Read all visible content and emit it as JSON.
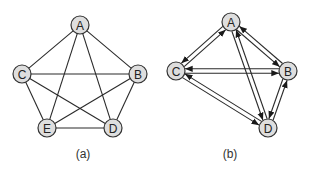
{
  "figure": {
    "node_radius": 9,
    "colors": {
      "node_fill": "#dedede",
      "node_stroke": "#333333",
      "edge": "#2a2a2a",
      "background": "#ffffff"
    },
    "panels": [
      {
        "id": "a",
        "caption": "(a)",
        "caption_pos": [
          83,
          158
        ],
        "directed": false,
        "nodes": [
          {
            "id": "A",
            "label": "A",
            "x": 80,
            "y": 25
          },
          {
            "id": "B",
            "label": "B",
            "x": 138,
            "y": 74
          },
          {
            "id": "C",
            "label": "C",
            "x": 22,
            "y": 74
          },
          {
            "id": "D",
            "label": "D",
            "x": 113,
            "y": 128
          },
          {
            "id": "E",
            "label": "E",
            "x": 47,
            "y": 128
          }
        ],
        "edges": [
          [
            "A",
            "B"
          ],
          [
            "A",
            "C"
          ],
          [
            "A",
            "D"
          ],
          [
            "A",
            "E"
          ],
          [
            "B",
            "C"
          ],
          [
            "B",
            "D"
          ],
          [
            "B",
            "E"
          ],
          [
            "C",
            "D"
          ],
          [
            "C",
            "E"
          ],
          [
            "D",
            "E"
          ]
        ]
      },
      {
        "id": "b",
        "caption": "(b)",
        "caption_pos": [
          230,
          158
        ],
        "directed": true,
        "nodes": [
          {
            "id": "A",
            "label": "A",
            "x": 231,
            "y": 22
          },
          {
            "id": "B",
            "label": "B",
            "x": 288,
            "y": 71
          },
          {
            "id": "C",
            "label": "C",
            "x": 176,
            "y": 71
          },
          {
            "id": "D",
            "label": "D",
            "x": 268,
            "y": 128
          }
        ],
        "edges": [
          [
            "A",
            "C"
          ],
          [
            "C",
            "A"
          ],
          [
            "A",
            "B"
          ],
          [
            "B",
            "A"
          ],
          [
            "C",
            "B"
          ],
          [
            "B",
            "C"
          ],
          [
            "A",
            "D"
          ],
          [
            "D",
            "A"
          ],
          [
            "C",
            "D"
          ],
          [
            "D",
            "C"
          ],
          [
            "B",
            "D"
          ],
          [
            "D",
            "B"
          ]
        ]
      }
    ]
  }
}
